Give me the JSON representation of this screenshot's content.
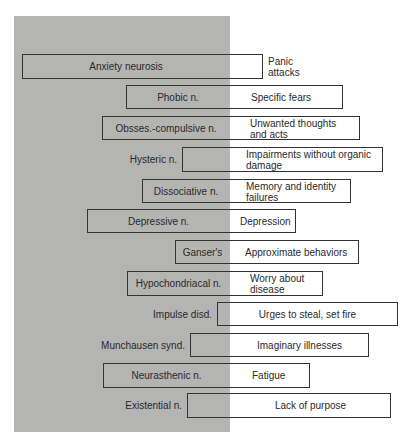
{
  "diagram": {
    "panel": {
      "color": "#b4b4b2"
    },
    "rows": [
      {
        "disorder": "Anxiety neurosis",
        "symptom": "Panic attacks",
        "symptom_lines": [
          "Panic",
          "attacks"
        ]
      },
      {
        "disorder": "Phobic n.",
        "symptom": "Specific fears"
      },
      {
        "disorder": "Obsses.-compulsive n.",
        "symptom": "Unwanted thoughts and acts",
        "symptom_lines": [
          "Unwanted thoughts",
          "and acts"
        ]
      },
      {
        "disorder": "Hysteric n.",
        "symptom": "Impairments without organic damage",
        "symptom_lines": [
          "Impairments without organic",
          "damage"
        ]
      },
      {
        "disorder": "Dissociative n.",
        "symptom": "Memory and identity failures",
        "symptom_lines": [
          "Memory and identity",
          "failures"
        ]
      },
      {
        "disorder": "Depressive n.",
        "symptom": "Depression"
      },
      {
        "disorder": "Ganser's",
        "symptom": "Approximate behaviors"
      },
      {
        "disorder": "Hypochondriacal n.",
        "symptom": "Worry about disease",
        "symptom_lines": [
          "Worry about",
          "disease"
        ]
      },
      {
        "disorder": "Impulse disd.",
        "symptom": "Urges to steal, set fire"
      },
      {
        "disorder": "Munchausen synd.",
        "symptom": "Imaginary illnesses"
      },
      {
        "disorder": "Neurasthenic n.",
        "symptom": "Fatigue"
      },
      {
        "disorder": "Existential n.",
        "symptom": "Lack of purpose"
      }
    ]
  }
}
